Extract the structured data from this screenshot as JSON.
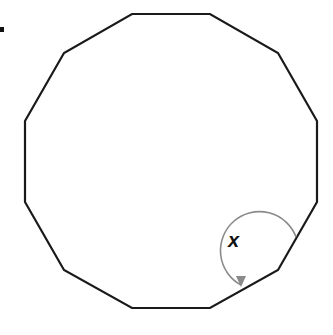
{
  "figure": {
    "shape": "regular dodecagon",
    "sides": 12,
    "angle_label": "x",
    "angle_marked_vertex": "lower-right",
    "stroke_color": "#1a1a1a",
    "arc_color": "#8a8a8a",
    "vertices": [
      [
        132,
        14
      ],
      [
        210,
        14
      ],
      [
        278,
        53
      ],
      [
        317,
        121
      ],
      [
        317,
        202
      ],
      [
        278,
        270
      ],
      [
        210,
        308
      ],
      [
        132,
        308
      ],
      [
        64,
        270
      ],
      [
        25,
        202
      ],
      [
        25,
        121
      ],
      [
        64,
        53
      ]
    ]
  }
}
